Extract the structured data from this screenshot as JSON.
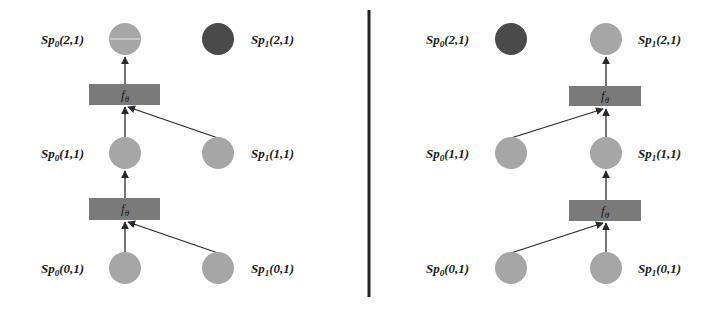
{
  "colors": {
    "node_light": "#a6a6a6",
    "node_dark": "#4a4a4a",
    "function_box": "#7a7a7a",
    "edge": "#2a2a2a",
    "divider": "#222222",
    "text": "#1a1a1a"
  },
  "panels": [
    {
      "name": "left",
      "nodes": [
        {
          "id": "sp0_2_1",
          "base": "Sp",
          "sub": "0",
          "coord": "(2,1)",
          "x": 125,
          "y": 39,
          "shade": "light"
        },
        {
          "id": "sp1_2_1",
          "base": "Sp",
          "sub": "1",
          "coord": "(2,1)",
          "x": 218,
          "y": 39,
          "shade": "dark"
        },
        {
          "id": "sp0_1_1",
          "base": "Sp",
          "sub": "0",
          "coord": "(1,1)",
          "x": 125,
          "y": 153,
          "shade": "light"
        },
        {
          "id": "sp1_1_1",
          "base": "Sp",
          "sub": "1",
          "coord": "(1,1)",
          "x": 218,
          "y": 153,
          "shade": "light"
        },
        {
          "id": "sp0_0_1",
          "base": "Sp",
          "sub": "0",
          "coord": "(0,1)",
          "x": 125,
          "y": 268,
          "shade": "light"
        },
        {
          "id": "sp1_0_1",
          "base": "Sp",
          "sub": "1",
          "coord": "(0,1)",
          "x": 218,
          "y": 268,
          "shade": "light"
        }
      ],
      "functions": [
        {
          "label": "f",
          "sub": "θ",
          "x": 89,
          "y": 84,
          "w": 71,
          "h": 21
        },
        {
          "label": "f",
          "sub": "θ",
          "x": 89,
          "y": 198,
          "w": 71,
          "h": 22
        }
      ]
    },
    {
      "name": "right",
      "nodes": [
        {
          "id": "sp0_2_1",
          "base": "Sp",
          "sub": "0",
          "coord": "(2,1)",
          "x": 511,
          "y": 39,
          "shade": "dark"
        },
        {
          "id": "sp1_2_1",
          "base": "Sp",
          "sub": "1",
          "coord": "(2,1)",
          "x": 606,
          "y": 39,
          "shade": "light"
        },
        {
          "id": "sp0_1_1",
          "base": "Sp",
          "sub": "0",
          "coord": "(1,1)",
          "x": 511,
          "y": 153,
          "shade": "light"
        },
        {
          "id": "sp1_1_1",
          "base": "Sp",
          "sub": "1",
          "coord": "(1,1)",
          "x": 606,
          "y": 153,
          "shade": "light"
        },
        {
          "id": "sp0_0_1",
          "base": "Sp",
          "sub": "0",
          "coord": "(0,1)",
          "x": 511,
          "y": 268,
          "shade": "light"
        },
        {
          "id": "sp1_0_1",
          "base": "Sp",
          "sub": "1",
          "coord": "(0,1)",
          "x": 606,
          "y": 268,
          "shade": "light"
        }
      ],
      "functions": [
        {
          "label": "f",
          "sub": "θ",
          "x": 569,
          "y": 86,
          "w": 72,
          "h": 20
        },
        {
          "label": "f",
          "sub": "θ",
          "x": 569,
          "y": 200,
          "w": 72,
          "h": 21
        }
      ]
    }
  ],
  "labels": {
    "left": {
      "sp0_2_1": {
        "base": "Sp",
        "sub": "0",
        "coord": "(2,1)"
      },
      "sp1_2_1": {
        "base": "Sp",
        "sub": "1",
        "coord": "(2,1)"
      },
      "sp0_1_1": {
        "base": "Sp",
        "sub": "0",
        "coord": "(1,1)"
      },
      "sp1_1_1": {
        "base": "Sp",
        "sub": "1",
        "coord": "(1,1)"
      },
      "sp0_0_1": {
        "base": "Sp",
        "sub": "0",
        "coord": "(0,1)"
      },
      "sp1_0_1": {
        "base": "Sp",
        "sub": "1",
        "coord": "(0,1)"
      },
      "f_top": {
        "base": "f",
        "sub": "θ"
      },
      "f_bottom": {
        "base": "f",
        "sub": "θ"
      }
    },
    "right": {
      "sp0_2_1": {
        "base": "Sp",
        "sub": "0",
        "coord": "(2,1)"
      },
      "sp1_2_1": {
        "base": "Sp",
        "sub": "1",
        "coord": "(2,1)"
      },
      "sp0_1_1": {
        "base": "Sp",
        "sub": "0",
        "coord": "(1,1)"
      },
      "sp1_1_1": {
        "base": "Sp",
        "sub": "1",
        "coord": "(1,1)"
      },
      "sp0_0_1": {
        "base": "Sp",
        "sub": "0",
        "coord": "(0,1)"
      },
      "sp1_0_1": {
        "base": "Sp",
        "sub": "1",
        "coord": "(0,1)"
      },
      "f_top": {
        "base": "f",
        "sub": "θ"
      },
      "f_bottom": {
        "base": "f",
        "sub": "θ"
      }
    }
  }
}
